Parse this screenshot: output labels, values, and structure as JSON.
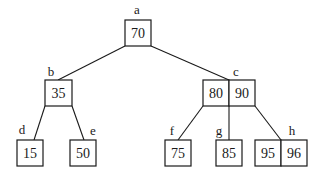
{
  "diagram": {
    "type": "b-tree",
    "nodes": {
      "a": {
        "label": "a",
        "keys": [
          "70"
        ]
      },
      "b": {
        "label": "b",
        "keys": [
          "35"
        ]
      },
      "c": {
        "label": "c",
        "keys": [
          "80",
          "90"
        ]
      },
      "d": {
        "label": "d",
        "keys": [
          "15"
        ]
      },
      "e": {
        "label": "e",
        "keys": [
          "50"
        ]
      },
      "f": {
        "label": "f",
        "keys": [
          "75"
        ]
      },
      "g": {
        "label": "g",
        "keys": [
          "85"
        ]
      },
      "h": {
        "label": "h",
        "keys": [
          "95",
          "96"
        ]
      }
    },
    "edges": [
      [
        "a",
        "b"
      ],
      [
        "a",
        "c"
      ],
      [
        "b",
        "d"
      ],
      [
        "b",
        "e"
      ],
      [
        "c",
        "f"
      ],
      [
        "c",
        "g"
      ],
      [
        "c",
        "h"
      ]
    ]
  }
}
